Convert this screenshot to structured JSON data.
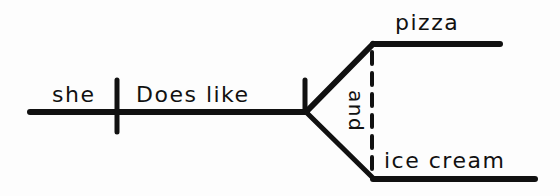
{
  "diagram": {
    "type": "sentence-diagram",
    "subject": "she",
    "predicate": "Does like",
    "compound_object": {
      "conjunction": "and",
      "items": [
        "pizza",
        "ice cream"
      ]
    }
  },
  "colors": {
    "ink": "#111111",
    "paper": "#fdfdfd"
  }
}
